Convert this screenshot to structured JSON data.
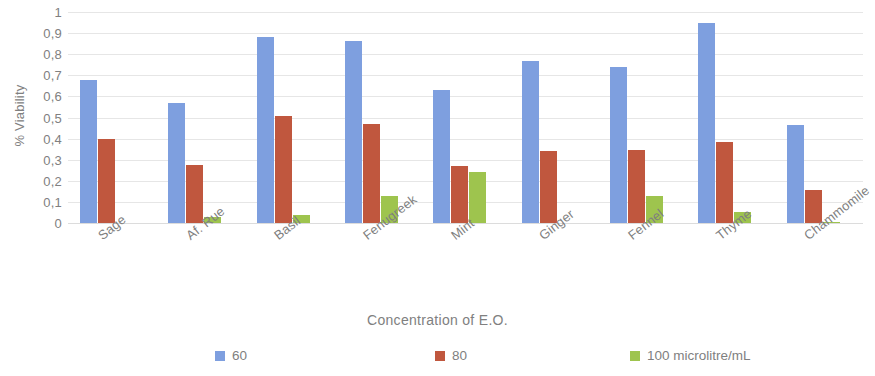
{
  "chart_data": {
    "type": "bar",
    "title": "",
    "xlabel": "Concentration  of E.O.",
    "ylabel": "% Viability",
    "ylim": [
      0,
      1
    ],
    "grid": true,
    "legend_position": "bottom",
    "decimal_separator": ",",
    "categories": [
      "Sage",
      "Af. Rue",
      "Basil",
      "Fenugreek",
      "Mint",
      "Ginger",
      "Fennel",
      "Thyme",
      "Chammomile"
    ],
    "ytick_labels": [
      "0",
      "0,1",
      "0,2",
      "0,3",
      "0,4",
      "0,5",
      "0,6",
      "0,7",
      "0,8",
      "0,9",
      "1"
    ],
    "ytick_values": [
      0,
      0.1,
      0.2,
      0.3,
      0.4,
      0.5,
      0.6,
      0.7,
      0.8,
      0.9,
      1
    ],
    "series": [
      {
        "name": "60",
        "color": "#7e9fdf",
        "values": [
          0.68,
          0.57,
          0.88,
          0.865,
          0.63,
          0.77,
          0.74,
          0.95,
          0.465
        ]
      },
      {
        "name": "80",
        "color": "#c0573e",
        "values": [
          0.4,
          0.275,
          0.505,
          0.47,
          0.27,
          0.34,
          0.345,
          0.385,
          0.155
        ]
      },
      {
        "name": "100 microlitre/mL",
        "color": "#9ec44e",
        "values": [
          0.0,
          0.03,
          0.04,
          0.13,
          0.24,
          0.0,
          0.13,
          0.05,
          0.006
        ]
      }
    ]
  }
}
